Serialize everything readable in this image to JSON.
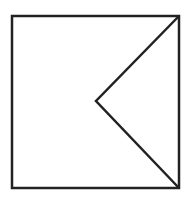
{
  "diagram": {
    "background": "#ffffff",
    "stroke": "#222222",
    "stroke_width": 2.5,
    "square": {
      "x": 12,
      "y": 16,
      "width": 167,
      "height": 172
    },
    "chevron": {
      "points": [
        [
          179,
          16
        ],
        [
          96,
          101
        ],
        [
          179,
          188
        ]
      ]
    }
  }
}
